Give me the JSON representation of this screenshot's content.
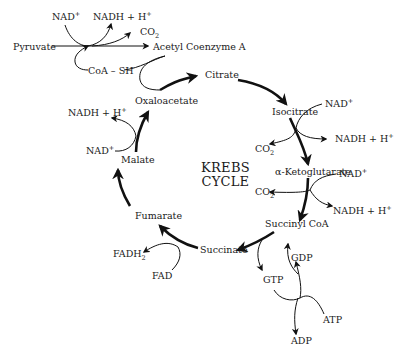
{
  "diagram": {
    "title_line1": "KREBS",
    "title_line2": "CYCLE",
    "entry": {
      "pyruvate": "Pyruvate",
      "acetyl_coa": "Acetyl Coenzyme A",
      "nad": "NAD",
      "nad_sup": "+",
      "nadh": "NADH + H",
      "nadh_sup": "+",
      "co2": "CO",
      "co2_sub": "2",
      "coash": "CoA – SH"
    },
    "intermediates": {
      "citrate": "Citrate",
      "isocitrate": "Isocitrate",
      "alpha_ketoglutarate": "α-Ketoglutarate",
      "succinyl_coa": "Succinyl CoA",
      "succinate": "Succinate",
      "fumarate": "Fumarate",
      "malate": "Malate",
      "oxaloacetate": "Oxaloacetate"
    },
    "side": {
      "iso_nad": "NAD",
      "iso_nadh": "NADH + H",
      "iso_co2": "CO",
      "akg_nad": "NAD",
      "akg_nadh": "NADH + H",
      "akg_co2": "CO",
      "gdp": "GDP",
      "gtp": "GTP",
      "atp": "ATP",
      "adp": "ADP",
      "fad": "FAD",
      "fadh": "FADH",
      "fadh_sub": "2",
      "mal_nad": "NAD",
      "mal_nadh": "NADH + H",
      "sup_plus": "+",
      "sub_two": "2"
    }
  }
}
